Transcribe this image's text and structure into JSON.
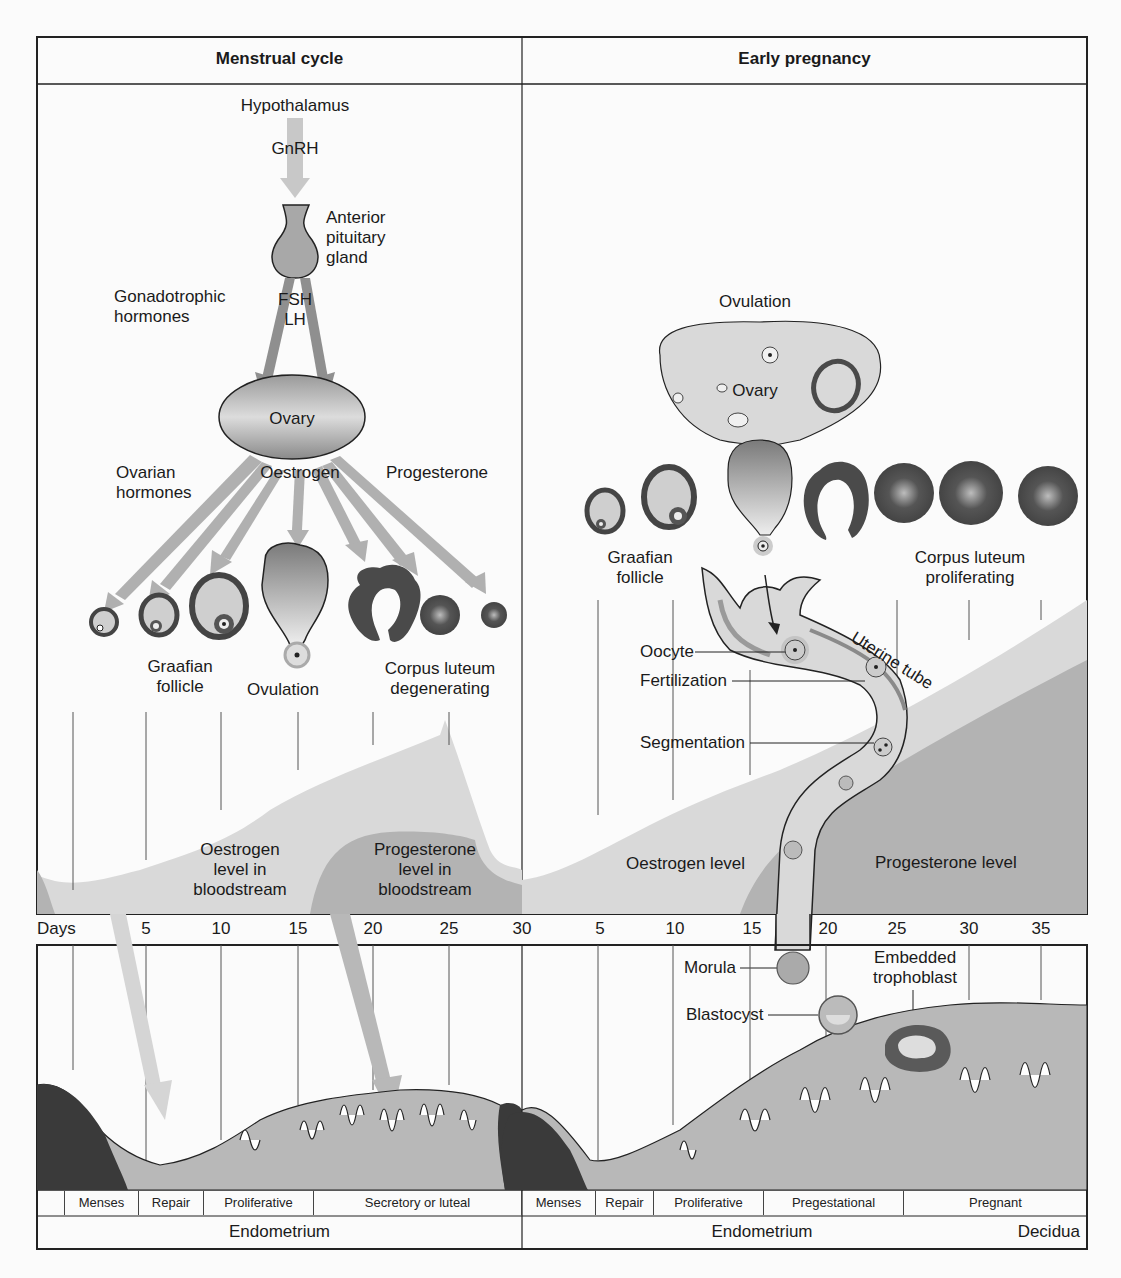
{
  "panels": {
    "left": {
      "title": "Menstrual cycle",
      "labels": {
        "hypothalamus": "Hypothalamus",
        "gnrh": "GnRH",
        "anterior_pituitary": [
          "Anterior",
          "pituitary",
          "gland"
        ],
        "gonadotrophic": [
          "Gonadotrophic",
          "hormones"
        ],
        "fsh": "FSH",
        "lh": "LH",
        "ovary": "Ovary",
        "ovarian_hormones": [
          "Ovarian",
          "hormones"
        ],
        "oestrogen": "Oestrogen",
        "progesterone": "Progesterone",
        "graafian_follicle": [
          "Graafian",
          "follicle"
        ],
        "ovulation": "Ovulation",
        "corpus_luteum": [
          "Corpus luteum",
          "degenerating"
        ],
        "oestrogen_level": [
          "Oestrogen",
          "level in",
          "bloodstream"
        ],
        "progesterone_level": [
          "Progesterone",
          "level in",
          "bloodstream"
        ]
      },
      "phases": [
        "Menses",
        "Repair",
        "Proliferative",
        "Secretory or luteal"
      ],
      "region": "Endometrium"
    },
    "right": {
      "title": "Early pregnancy",
      "labels": {
        "ovulation": "Ovulation",
        "ovary": "Ovary",
        "graafian_follicle": [
          "Graafian",
          "follicle"
        ],
        "corpus_luteum": [
          "Corpus luteum",
          "proliferating"
        ],
        "uterine_tube": "Uterine tube",
        "oocyte": "Oocyte",
        "fertilization": "Fertilization",
        "segmentation": "Segmentation",
        "oestrogen_level": "Oestrogen level",
        "progesterone_level": "Progesterone level",
        "morula": "Morula",
        "blastocyst": "Blastocyst",
        "embedded_trophoblast": [
          "Embedded",
          "trophoblast"
        ]
      },
      "phases": [
        "Menses",
        "Repair",
        "Proliferative",
        "Pregestational",
        "Pregnant"
      ],
      "region_left": "Endometrium",
      "region_right": "Decidua"
    }
  },
  "axis": {
    "label": "Days",
    "left_ticks": [
      "5",
      "10",
      "15",
      "20",
      "25",
      "30"
    ],
    "right_ticks": [
      "5",
      "10",
      "15",
      "20",
      "25",
      "30",
      "35"
    ]
  },
  "colors": {
    "light_gray": "#d9d9d9",
    "mid_gray": "#b3b3b3",
    "dark_gray": "#4a4a4a",
    "outline": "#222222"
  }
}
